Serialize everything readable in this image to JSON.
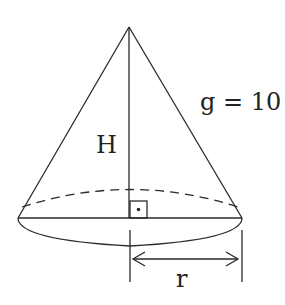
{
  "diagram": {
    "type": "cone",
    "labels": {
      "height": "H",
      "slant": "g = 10",
      "radius": "r"
    },
    "right_angle_marker": true,
    "colors": {
      "stroke": "#2a2a2a",
      "background": "#ffffff"
    }
  }
}
